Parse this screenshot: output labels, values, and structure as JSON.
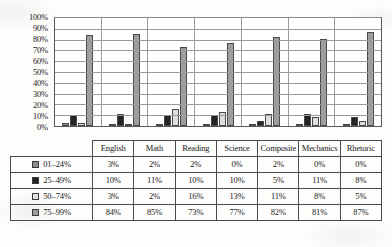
{
  "chart_data": {
    "type": "bar",
    "title": "",
    "xlabel": "",
    "ylabel": "",
    "ylim": [
      0,
      100
    ],
    "grid": true,
    "legend_position": "table-left",
    "categories": [
      "English",
      "Math",
      "Reading",
      "Science",
      "Composite",
      "Mechanics",
      "Rhetoric"
    ],
    "yticks": [
      "100%",
      "90%",
      "80%",
      "70%",
      "60%",
      "50%",
      "40%",
      "30%",
      "20%",
      "10%",
      "0%"
    ],
    "ytick_values": [
      100,
      90,
      80,
      70,
      60,
      50,
      40,
      30,
      20,
      10,
      0
    ],
    "series": [
      {
        "name": "01–24%",
        "color": "#8d8d8d",
        "values": [
          3,
          2,
          2,
          0,
          2,
          0,
          0
        ],
        "labels": [
          "3%",
          "2%",
          "2%",
          "0%",
          "2%",
          "0%",
          "0%"
        ]
      },
      {
        "name": "25–49%",
        "color": "#242424",
        "values": [
          10,
          11,
          10,
          10,
          5,
          11,
          8
        ],
        "labels": [
          "10%",
          "11%",
          "10%",
          "10%",
          "5%",
          "11%",
          "8%"
        ]
      },
      {
        "name": "50–74%",
        "color": "#dedede",
        "values": [
          3,
          2,
          16,
          13,
          11,
          8,
          5
        ],
        "labels": [
          "3%",
          "2%",
          "16%",
          "13%",
          "11%",
          "8%",
          "5%"
        ]
      },
      {
        "name": "75–99%",
        "color": "#9e9e9e",
        "values": [
          84,
          85,
          73,
          77,
          82,
          81,
          87
        ],
        "labels": [
          "84%",
          "85%",
          "73%",
          "77%",
          "82%",
          "81%",
          "87%"
        ]
      }
    ]
  }
}
